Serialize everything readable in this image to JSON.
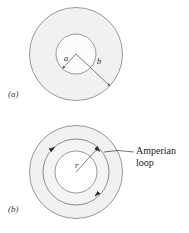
{
  "figure": {
    "background_color": "#ffffff",
    "stroke_color": "#8a8a8a",
    "fill_annulus_color": "#f0f0f0",
    "fill_core_color": "#fafafa",
    "text_color": "#1c1c1c"
  },
  "panels": [
    {
      "id": "a",
      "caption": "(a)",
      "labels": {
        "inner_radius": "a",
        "outer_radius": "b"
      },
      "geometry": {
        "center_x": 76,
        "center_y": 54,
        "outer_radius": 47,
        "inner_radius": 20
      }
    },
    {
      "id": "b",
      "caption": "(b)",
      "labels": {
        "loop_radius": "r",
        "annotation_line1": "Amperian",
        "annotation_line2": "loop"
      },
      "geometry": {
        "center_x": 76,
        "center_y": 172,
        "outer_radius": 47,
        "loop_radius": 33,
        "inner_radius": 21
      }
    }
  ],
  "annotation": {
    "text": "Amperian loop",
    "leader_from_x": 135,
    "leader_from_y": 152,
    "leader_to_x": 105,
    "leader_to_y": 152
  }
}
